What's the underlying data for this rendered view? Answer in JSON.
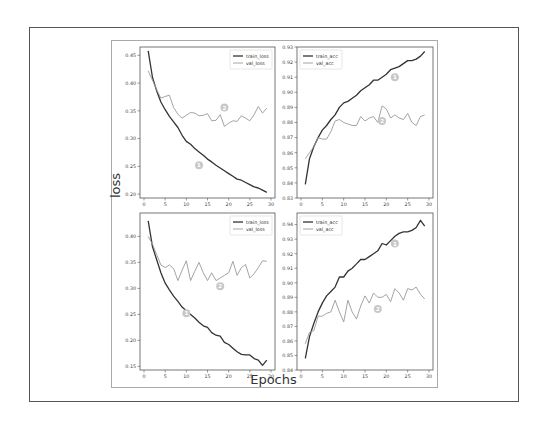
{
  "figure": {
    "ylabel": "loss",
    "xlabel": "Epochs"
  },
  "colors": {
    "train": "#333333",
    "val": "#9a9a9a",
    "marker": "#c8c8c8",
    "axis": "#555555"
  },
  "chart_data": [
    {
      "type": "line",
      "id": "top-left",
      "title": "",
      "xlabel": "",
      "ylabel": "loss",
      "xlim": [
        0,
        30
      ],
      "ylim": [
        0.193,
        0.465
      ],
      "xticks": [
        0,
        5,
        10,
        15,
        20,
        25,
        30
      ],
      "yticks": [
        0.2,
        0.25,
        0.3,
        0.35,
        0.4,
        0.45
      ],
      "ytick_labels": [
        "0.20",
        "0.25",
        "0.30",
        "0.35",
        "0.40",
        "0.45"
      ],
      "legend": {
        "position": "upper right",
        "entries": [
          "train_loss",
          "val_loss"
        ]
      },
      "annotations": [
        {
          "label": "1",
          "x": 13,
          "y": 0.252
        },
        {
          "label": "2",
          "x": 19,
          "y": 0.356
        }
      ],
      "x": [
        1,
        2,
        3,
        4,
        5,
        6,
        7,
        8,
        9,
        10,
        11,
        12,
        13,
        14,
        15,
        16,
        17,
        18,
        19,
        20,
        21,
        22,
        23,
        24,
        25,
        26,
        27,
        28,
        29
      ],
      "series": [
        {
          "name": "train_loss",
          "values": [
            0.458,
            0.41,
            0.386,
            0.366,
            0.352,
            0.34,
            0.33,
            0.32,
            0.306,
            0.295,
            0.29,
            0.282,
            0.276,
            0.27,
            0.263,
            0.258,
            0.252,
            0.247,
            0.242,
            0.237,
            0.232,
            0.227,
            0.225,
            0.221,
            0.217,
            0.213,
            0.211,
            0.207,
            0.203
          ]
        },
        {
          "name": "val_loss",
          "values": [
            0.422,
            0.405,
            0.388,
            0.373,
            0.376,
            0.378,
            0.356,
            0.344,
            0.337,
            0.342,
            0.347,
            0.346,
            0.341,
            0.342,
            0.345,
            0.332,
            0.333,
            0.343,
            0.322,
            0.328,
            0.332,
            0.331,
            0.341,
            0.337,
            0.332,
            0.343,
            0.358,
            0.346,
            0.355
          ]
        }
      ]
    },
    {
      "type": "line",
      "id": "top-right",
      "title": "",
      "xlabel": "",
      "ylabel": "",
      "xlim": [
        0,
        30
      ],
      "ylim": [
        0.83,
        0.93
      ],
      "xticks": [
        0,
        5,
        10,
        15,
        20,
        25,
        30
      ],
      "yticks": [
        0.83,
        0.84,
        0.85,
        0.86,
        0.87,
        0.88,
        0.89,
        0.9,
        0.91,
        0.92,
        0.93
      ],
      "ytick_labels": [
        "0.83",
        "0.84",
        "0.85",
        "0.86",
        "0.87",
        "0.88",
        "0.89",
        "0.90",
        "0.91",
        "0.92",
        "0.93"
      ],
      "legend": {
        "position": "upper left",
        "entries": [
          "train_acc",
          "val_acc"
        ]
      },
      "annotations": [
        {
          "label": "1",
          "x": 22,
          "y": 0.91
        },
        {
          "label": "2",
          "x": 19,
          "y": 0.881
        }
      ],
      "x": [
        1,
        2,
        3,
        4,
        5,
        6,
        7,
        8,
        9,
        10,
        11,
        12,
        13,
        14,
        15,
        16,
        17,
        18,
        19,
        20,
        21,
        22,
        23,
        24,
        25,
        26,
        27,
        28,
        29
      ],
      "series": [
        {
          "name": "train_acc",
          "values": [
            0.839,
            0.856,
            0.864,
            0.87,
            0.875,
            0.878,
            0.882,
            0.885,
            0.89,
            0.893,
            0.894,
            0.896,
            0.898,
            0.901,
            0.903,
            0.905,
            0.908,
            0.908,
            0.91,
            0.912,
            0.915,
            0.916,
            0.917,
            0.919,
            0.921,
            0.921,
            0.922,
            0.924,
            0.927
          ]
        },
        {
          "name": "val_acc",
          "values": [
            0.856,
            0.86,
            0.864,
            0.87,
            0.869,
            0.869,
            0.874,
            0.881,
            0.882,
            0.88,
            0.879,
            0.878,
            0.878,
            0.884,
            0.881,
            0.883,
            0.884,
            0.88,
            0.891,
            0.889,
            0.883,
            0.885,
            0.883,
            0.882,
            0.886,
            0.88,
            0.878,
            0.884,
            0.885
          ]
        }
      ]
    },
    {
      "type": "line",
      "id": "bottom-left",
      "title": "",
      "xlabel": "Epochs",
      "ylabel": "loss",
      "xlim": [
        0,
        30
      ],
      "ylim": [
        0.143,
        0.445
      ],
      "xticks": [
        0,
        5,
        10,
        15,
        20,
        25,
        30
      ],
      "yticks": [
        0.15,
        0.2,
        0.25,
        0.3,
        0.35,
        0.4
      ],
      "ytick_labels": [
        "0.15",
        "0.20",
        "0.25",
        "0.30",
        "0.35",
        "0.40"
      ],
      "legend": {
        "position": "upper right",
        "entries": [
          "train_loss",
          "val_loss"
        ]
      },
      "annotations": [
        {
          "label": "1",
          "x": 10,
          "y": 0.252
        },
        {
          "label": "2",
          "x": 18,
          "y": 0.304
        }
      ],
      "x": [
        1,
        2,
        3,
        4,
        5,
        6,
        7,
        8,
        9,
        10,
        11,
        12,
        13,
        14,
        15,
        16,
        17,
        18,
        19,
        20,
        21,
        22,
        23,
        24,
        25,
        26,
        27,
        28,
        29
      ],
      "series": [
        {
          "name": "train_loss",
          "values": [
            0.43,
            0.38,
            0.355,
            0.33,
            0.31,
            0.297,
            0.285,
            0.275,
            0.264,
            0.257,
            0.25,
            0.243,
            0.235,
            0.228,
            0.225,
            0.215,
            0.21,
            0.208,
            0.196,
            0.192,
            0.185,
            0.178,
            0.173,
            0.172,
            0.172,
            0.165,
            0.162,
            0.152,
            0.162
          ]
        },
        {
          "name": "val_loss",
          "values": [
            0.4,
            0.385,
            0.365,
            0.345,
            0.34,
            0.345,
            0.338,
            0.315,
            0.335,
            0.353,
            0.315,
            0.333,
            0.35,
            0.33,
            0.315,
            0.33,
            0.315,
            0.32,
            0.325,
            0.33,
            0.352,
            0.325,
            0.34,
            0.346,
            0.32,
            0.328,
            0.34,
            0.353,
            0.352
          ]
        }
      ]
    },
    {
      "type": "line",
      "id": "bottom-right",
      "title": "",
      "xlabel": "Epochs",
      "ylabel": "",
      "xlim": [
        0,
        30
      ],
      "ylim": [
        0.84,
        0.948
      ],
      "xticks": [
        0,
        5,
        10,
        15,
        20,
        25,
        30
      ],
      "yticks": [
        0.84,
        0.85,
        0.86,
        0.87,
        0.88,
        0.89,
        0.9,
        0.91,
        0.92,
        0.93,
        0.94
      ],
      "ytick_labels": [
        "0.84",
        "0.85",
        "0.86",
        "0.87",
        "0.88",
        "0.89",
        "0.90",
        "0.91",
        "0.92",
        "0.93",
        "0.94"
      ],
      "legend": {
        "position": "upper left",
        "entries": [
          "train_acc",
          "val_acc"
        ]
      },
      "annotations": [
        {
          "label": "1",
          "x": 22,
          "y": 0.927
        },
        {
          "label": "2",
          "x": 18,
          "y": 0.882
        }
      ],
      "x": [
        1,
        2,
        3,
        4,
        5,
        6,
        7,
        8,
        9,
        10,
        11,
        12,
        13,
        14,
        15,
        16,
        17,
        18,
        19,
        20,
        21,
        22,
        23,
        24,
        25,
        26,
        27,
        28,
        29
      ],
      "series": [
        {
          "name": "train_acc",
          "values": [
            0.848,
            0.863,
            0.872,
            0.88,
            0.886,
            0.891,
            0.894,
            0.897,
            0.904,
            0.904,
            0.908,
            0.91,
            0.913,
            0.916,
            0.916,
            0.918,
            0.92,
            0.922,
            0.927,
            0.926,
            0.929,
            0.932,
            0.934,
            0.935,
            0.935,
            0.936,
            0.938,
            0.943,
            0.939
          ]
        },
        {
          "name": "val_acc",
          "values": [
            0.858,
            0.866,
            0.867,
            0.877,
            0.877,
            0.879,
            0.88,
            0.888,
            0.88,
            0.873,
            0.888,
            0.88,
            0.875,
            0.884,
            0.891,
            0.886,
            0.893,
            0.89,
            0.89,
            0.892,
            0.887,
            0.896,
            0.893,
            0.888,
            0.896,
            0.895,
            0.897,
            0.892,
            0.889
          ]
        }
      ]
    }
  ]
}
